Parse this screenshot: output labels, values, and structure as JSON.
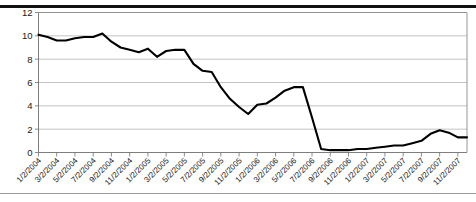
{
  "figure": {
    "top_rule": "thick-black-divider",
    "bottom_rule": "thin-gray-divider"
  },
  "chart_data": {
    "type": "line",
    "title": "",
    "subtitle": "",
    "xlabel": "",
    "ylabel": "",
    "ylim": [
      0,
      12
    ],
    "yticks": [
      0,
      2,
      4,
      6,
      8,
      10,
      12
    ],
    "ytick_labels": [
      "0",
      "2",
      "4",
      "6",
      "8",
      "10",
      "12"
    ],
    "grid": true,
    "grid_axis": "y",
    "legend": false,
    "legend_position": "none",
    "line_color": "#000000",
    "tick_label_rotation": -45,
    "x_tick_every_n_points": 2,
    "x": [
      "1/2/2004",
      "2/2/2004",
      "3/2/2004",
      "4/2/2004",
      "5/2/2004",
      "6/2/2004",
      "7/2/2004",
      "8/2/2004",
      "9/2/2004",
      "10/2/2004",
      "11/2/2004",
      "12/2/2004",
      "1/2/2005",
      "2/2/2005",
      "3/2/2005",
      "4/2/2005",
      "5/2/2005",
      "6/2/2005",
      "7/2/2005",
      "8/2/2005",
      "9/2/2005",
      "10/2/2005",
      "11/2/2005",
      "12/2/2005",
      "1/2/2006",
      "2/2/2006",
      "3/2/2006",
      "4/2/2006",
      "5/2/2006",
      "6/2/2006",
      "7/2/2006",
      "8/2/2006",
      "9/2/2006",
      "10/2/2006",
      "11/2/2006",
      "12/2/2006",
      "1/2/2007",
      "2/2/2007",
      "3/2/2007",
      "4/2/2007",
      "5/2/2007",
      "6/2/2007",
      "7/2/2007",
      "8/2/2007",
      "9/2/2007",
      "10/2/2007",
      "11/2/2007",
      "12/2/2007"
    ],
    "xtick_labels": [
      "1/2/2004",
      "3/2/2004",
      "5/2/2004",
      "7/2/2004",
      "9/2/2004",
      "11/2/2004",
      "1/2/2005",
      "3/2/2005",
      "5/2/2005",
      "7/2/2005",
      "9/2/2005",
      "11/2/2005",
      "1/2/2006",
      "3/2/2006",
      "5/2/2006",
      "7/2/2006",
      "9/2/2006",
      "11/2/2006",
      "1/2/2007",
      "3/2/2007",
      "5/2/2007",
      "7/2/2007",
      "9/2/2007",
      "11/2/2007"
    ],
    "values": [
      10.1,
      9.9,
      9.6,
      9.6,
      9.8,
      9.9,
      9.9,
      10.2,
      9.5,
      9.0,
      8.8,
      8.6,
      8.9,
      8.2,
      8.7,
      8.8,
      8.8,
      7.6,
      7.0,
      6.9,
      5.6,
      4.6,
      3.9,
      3.3,
      4.1,
      4.2,
      4.7,
      5.3,
      5.6,
      5.6,
      3.0,
      0.3,
      0.2,
      0.2,
      0.2,
      0.3,
      0.3,
      0.4,
      0.5,
      0.6,
      0.6,
      0.8,
      1.0,
      1.6,
      1.9,
      1.7,
      1.3,
      1.3
    ],
    "series": [
      {
        "name": "series-1",
        "color": "#000000",
        "values": [
          10.1,
          9.9,
          9.6,
          9.6,
          9.8,
          9.9,
          9.9,
          10.2,
          9.5,
          9.0,
          8.8,
          8.6,
          8.9,
          8.2,
          8.7,
          8.8,
          8.8,
          7.6,
          7.0,
          6.9,
          5.6,
          4.6,
          3.9,
          3.3,
          4.1,
          4.2,
          4.7,
          5.3,
          5.6,
          5.6,
          3.0,
          0.3,
          0.2,
          0.2,
          0.2,
          0.3,
          0.3,
          0.4,
          0.5,
          0.6,
          0.6,
          0.8,
          1.0,
          1.6,
          1.9,
          1.7,
          1.3,
          1.3
        ]
      }
    ]
  }
}
